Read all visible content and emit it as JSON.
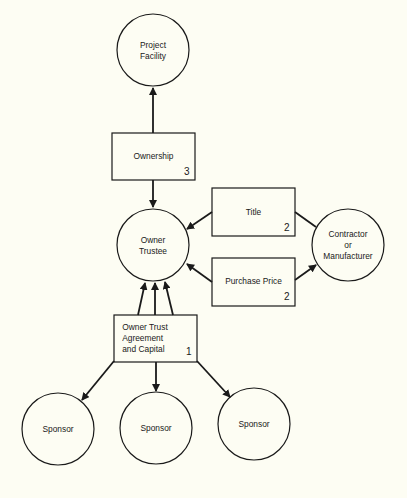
{
  "colors": {
    "background": "#fdfdf3",
    "stroke": "#1a1a1a"
  },
  "nodes": {
    "project_facility": {
      "line1": "Project",
      "line2": "Facility"
    },
    "ownership": {
      "label": "Ownership",
      "number": "3"
    },
    "owner_trustee": {
      "line1": "Owner",
      "line2": "Trustee"
    },
    "title": {
      "label": "Title",
      "number": "2"
    },
    "purchase_price": {
      "label": "Purchase Price",
      "number": "2"
    },
    "contractor": {
      "line1": "Contractor",
      "line2": "or",
      "line3": "Manufacturer"
    },
    "owner_trust": {
      "line1": "Owner Trust",
      "line2": "Agreement",
      "line3": "and Capital",
      "number": "1"
    },
    "sponsors": [
      {
        "label": "Sponsor"
      },
      {
        "label": "Sponsor"
      },
      {
        "label": "Sponsor"
      }
    ]
  },
  "edges": [
    {
      "from": "Ownership",
      "to": "Project Facility"
    },
    {
      "from": "Ownership",
      "to": "Owner Trustee"
    },
    {
      "from": "Title",
      "to": "Owner Trustee"
    },
    {
      "from": "Contractor or Manufacturer",
      "to": "Title",
      "arrow": false
    },
    {
      "from": "Purchase Price",
      "to": "Owner Trustee"
    },
    {
      "from": "Purchase Price",
      "to": "Contractor or Manufacturer"
    },
    {
      "from": "Owner Trust Agreement and Capital",
      "to": "Owner Trustee",
      "count": 3
    },
    {
      "from": "Owner Trust Agreement and Capital",
      "to": "Sponsor",
      "count": 3
    }
  ]
}
